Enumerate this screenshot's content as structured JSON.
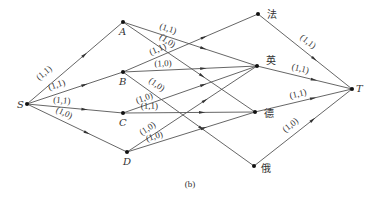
{
  "figure": {
    "caption": "(b)"
  },
  "nodes": [
    {
      "id": "S",
      "label": "S",
      "x": 27,
      "y": 104,
      "lx": 17,
      "ly": 108,
      "cjk": false
    },
    {
      "id": "A",
      "label": "A",
      "x": 123,
      "y": 22,
      "lx": 119,
      "ly": 35,
      "cjk": false
    },
    {
      "id": "B",
      "label": "B",
      "x": 123,
      "y": 72,
      "lx": 119,
      "ly": 85,
      "cjk": false
    },
    {
      "id": "C",
      "label": "C",
      "x": 123,
      "y": 113,
      "lx": 119,
      "ly": 126,
      "cjk": false
    },
    {
      "id": "D",
      "label": "D",
      "x": 127,
      "y": 152,
      "lx": 123,
      "ly": 165,
      "cjk": false
    },
    {
      "id": "fa",
      "label": "法",
      "x": 258,
      "y": 14,
      "lx": 267,
      "ly": 18,
      "cjk": true
    },
    {
      "id": "ying",
      "label": "英",
      "x": 257,
      "y": 66,
      "lx": 266,
      "ly": 64,
      "cjk": true
    },
    {
      "id": "de",
      "label": "德",
      "x": 255,
      "y": 112,
      "lx": 264,
      "ly": 117,
      "cjk": true
    },
    {
      "id": "e",
      "label": "俄",
      "x": 254,
      "y": 166,
      "lx": 261,
      "ly": 172,
      "cjk": true
    },
    {
      "id": "T",
      "label": "T",
      "x": 352,
      "y": 89,
      "lx": 356,
      "ly": 92,
      "cjk": false
    }
  ],
  "edges": [
    {
      "from": "S",
      "to": "A",
      "label": "(1,1)",
      "t": 0.28,
      "lrot": -42,
      "loff": [
        -8,
        -6
      ]
    },
    {
      "from": "S",
      "to": "B",
      "label": "(1,1)",
      "t": 0.36,
      "lrot": -18,
      "loff": [
        -4,
        -5
      ]
    },
    {
      "from": "S",
      "to": "C",
      "label": "(1,1)",
      "t": 0.36,
      "lrot": 4,
      "loff": [
        0,
        -4
      ]
    },
    {
      "from": "S",
      "to": "D",
      "label": "(1,0)",
      "t": 0.32,
      "lrot": 24,
      "loff": [
        4,
        -4
      ]
    },
    {
      "from": "A",
      "to": "ying",
      "label": "(1,1)",
      "t": 0.3,
      "lrot": 15,
      "loff": [
        4,
        -4
      ]
    },
    {
      "from": "A",
      "to": "de",
      "label": "(1,0)",
      "t": 0.28,
      "lrot": 35,
      "loff": [
        6,
        -4
      ]
    },
    {
      "from": "B",
      "to": "fa",
      "label": "(1,1)",
      "t": 0.28,
      "lrot": -23,
      "loff": [
        -2,
        -4
      ]
    },
    {
      "from": "B",
      "to": "ying",
      "label": "(1,0)",
      "t": 0.3,
      "lrot": -3,
      "loff": [
        0,
        -4
      ]
    },
    {
      "from": "B",
      "to": "e",
      "label": "(1,0)",
      "t": 0.2,
      "lrot": 33,
      "loff": [
        6,
        -4
      ]
    },
    {
      "from": "C",
      "to": "ying",
      "label": "(1,0)",
      "t": 0.18,
      "lrot": -20,
      "loff": [
        -2,
        -4
      ]
    },
    {
      "from": "C",
      "to": "de",
      "label": "(1,1)",
      "t": 0.2,
      "lrot": 0,
      "loff": [
        0,
        -4
      ]
    },
    {
      "from": "D",
      "to": "ying",
      "label": "(1,0)",
      "t": 0.2,
      "lrot": -35,
      "loff": [
        -4,
        -4
      ]
    },
    {
      "from": "D",
      "to": "de",
      "label": "(1,0)",
      "t": 0.22,
      "lrot": -20,
      "loff": [
        0,
        -4
      ]
    },
    {
      "from": "fa",
      "to": "T",
      "label": "(1,1)",
      "t": 0.45,
      "lrot": 42,
      "loff": [
        6,
        -4
      ]
    },
    {
      "from": "ying",
      "to": "T",
      "label": "(1,1)",
      "t": 0.45,
      "lrot": 12,
      "loff": [
        0,
        -5
      ]
    },
    {
      "from": "de",
      "to": "T",
      "label": "(1,1)",
      "t": 0.45,
      "lrot": -12,
      "loff": [
        0,
        -5
      ]
    },
    {
      "from": "e",
      "to": "T",
      "label": "(1,0)",
      "t": 0.45,
      "lrot": -38,
      "loff": [
        -6,
        -4
      ]
    }
  ]
}
